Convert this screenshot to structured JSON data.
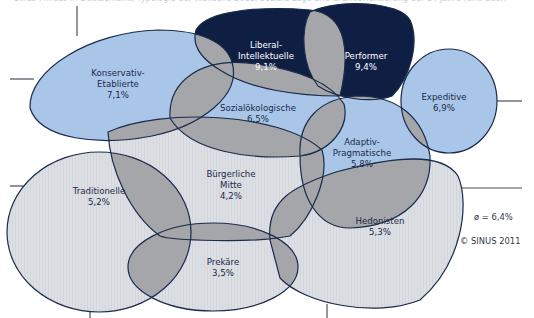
{
  "caption": "Sinus-Milieus in Deutschland, Typologie der Wünsche 2011, Soziale Lage und Grundorientierung der 14 Jahre (und älter)",
  "colors": {
    "outline": "#1b2b4b",
    "upper_fill": "#a9c6e8",
    "elite_fill": "#0f1f44",
    "lower_fill": "#dcdfe3",
    "overlap_fill": "#a5a6a9",
    "grid": "#4a4f5c"
  },
  "milieus": [
    {
      "id": "konservativ-etablierte",
      "line1": "Konservativ-",
      "line2": "Etablierte",
      "value": "7,1%"
    },
    {
      "id": "liberal-intellektuelle",
      "line1": "Liberal-",
      "line2": "Intellektuelle",
      "value": "9,1%"
    },
    {
      "id": "performer",
      "line1": "Performer",
      "value": "9,4%"
    },
    {
      "id": "expeditive",
      "line1": "Expeditive",
      "value": "6,9%"
    },
    {
      "id": "sozialoekologische",
      "line1": "Sozialökologische",
      "value": "6,5%"
    },
    {
      "id": "adaptiv-pragmatische",
      "line1": "Adaptiv-",
      "line2": "Pragmatische",
      "value": "5,8%"
    },
    {
      "id": "buergerliche-mitte",
      "line1": "Bürgerliche",
      "line2": "Mitte",
      "value": "4,2%"
    },
    {
      "id": "traditionelle",
      "line1": "Traditionelle",
      "value": "5,2%"
    },
    {
      "id": "hedonisten",
      "line1": "Hedonisten",
      "value": "5,3%"
    },
    {
      "id": "prekaere",
      "line1": "Prekäre",
      "value": "3,5%"
    }
  ],
  "legend": {
    "average": "ø = 6,4%",
    "copyright": "© SINUS 2011"
  }
}
